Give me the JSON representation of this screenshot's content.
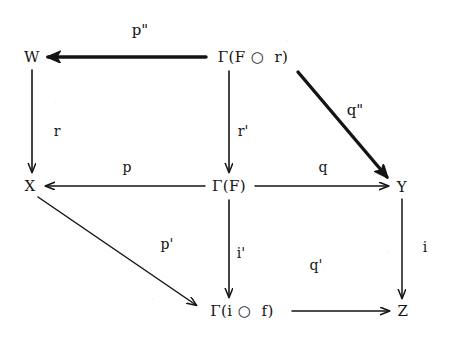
{
  "figure": {
    "kind": "commutative-diagram",
    "background_color": "#ffffff",
    "ink_color": "#141414",
    "width": 463,
    "height": 340
  },
  "nodes": [
    {
      "id": "W",
      "label": "W",
      "x": 32,
      "y": 57
    },
    {
      "id": "GFr",
      "label": "Γ(F ○  r)",
      "x": 253,
      "y": 57
    },
    {
      "id": "X",
      "label": "X",
      "x": 30,
      "y": 186
    },
    {
      "id": "GF",
      "label": "Γ(F)",
      "x": 229,
      "y": 186
    },
    {
      "id": "Y",
      "label": "Y",
      "x": 402,
      "y": 187
    },
    {
      "id": "Gif",
      "label": "Γ(i ○  f)",
      "x": 242,
      "y": 311
    },
    {
      "id": "Z",
      "label": "Z",
      "x": 403,
      "y": 311
    }
  ],
  "edges": [
    {
      "id": "p2",
      "label": "p\"",
      "from": "GFr",
      "to": "W",
      "label_x": 140,
      "label_y": 30,
      "weight": "bold"
    },
    {
      "id": "r",
      "label": "r",
      "from": "W",
      "to": "X",
      "label_x": 57,
      "label_y": 131,
      "weight": "normal"
    },
    {
      "id": "r1",
      "label": "r'",
      "from": "GFr",
      "to": "GF",
      "label_x": 243,
      "label_y": 131,
      "weight": "normal"
    },
    {
      "id": "q2",
      "label": "q\"",
      "from": "GFr",
      "to": "Y",
      "label_x": 355,
      "label_y": 110,
      "weight": "bold"
    },
    {
      "id": "p",
      "label": "p",
      "from": "GF",
      "to": "X",
      "label_x": 127,
      "label_y": 167,
      "weight": "normal"
    },
    {
      "id": "q",
      "label": "q",
      "from": "GF",
      "to": "Y",
      "label_x": 323,
      "label_y": 167,
      "weight": "normal"
    },
    {
      "id": "p1",
      "label": "p'",
      "from": "X",
      "to": "Gif",
      "label_x": 167,
      "label_y": 244,
      "weight": "normal"
    },
    {
      "id": "i1",
      "label": "i'",
      "from": "GF",
      "to": "Gif",
      "label_x": 241,
      "label_y": 253,
      "weight": "normal"
    },
    {
      "id": "i",
      "label": "i",
      "from": "Y",
      "to": "Z",
      "label_x": 425,
      "label_y": 247,
      "weight": "normal"
    },
    {
      "id": "q1",
      "label": "q'",
      "from": "Gif",
      "to": "Z",
      "label_x": 316,
      "label_y": 265,
      "weight": "normal"
    }
  ]
}
